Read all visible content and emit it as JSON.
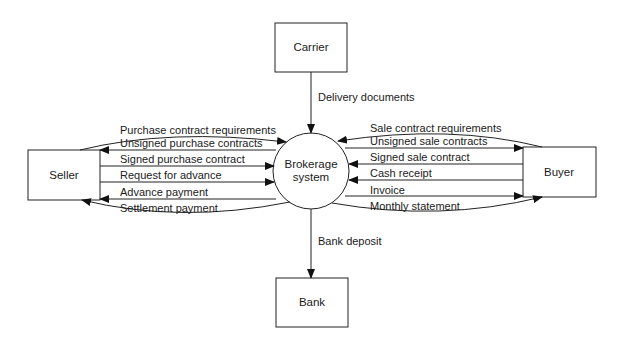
{
  "diagram": {
    "type": "context data flow diagram",
    "entities": {
      "carrier": "Carrier",
      "seller": "Seller",
      "buyer": "Buyer",
      "bank": "Bank"
    },
    "process": {
      "line1": "Brokerage",
      "line2": "system"
    },
    "flows": {
      "delivery_documents": "Delivery documents",
      "bank_deposit": "Bank deposit",
      "seller": [
        {
          "label": "Purchase contract requirements",
          "direction": "to-system"
        },
        {
          "label": "Unsigned purchase contracts",
          "direction": "to-seller"
        },
        {
          "label": "Signed purchase contract",
          "direction": "to-system"
        },
        {
          "label": "Request for advance",
          "direction": "to-system"
        },
        {
          "label": "Advance payment",
          "direction": "to-seller"
        },
        {
          "label": "Settlement payment",
          "direction": "to-seller"
        }
      ],
      "buyer": [
        {
          "label": "Sale contract requirements",
          "direction": "to-system"
        },
        {
          "label": "Unsigned sale contracts",
          "direction": "to-buyer"
        },
        {
          "label": "Signed sale contract",
          "direction": "to-system"
        },
        {
          "label": "Cash receipt",
          "direction": "to-system"
        },
        {
          "label": "Invoice",
          "direction": "to-buyer"
        },
        {
          "label": "Monthly statement",
          "direction": "to-buyer"
        }
      ]
    }
  }
}
